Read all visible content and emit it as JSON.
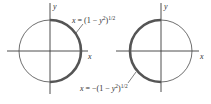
{
  "figure": {
    "panels": [
      {
        "id": "right-half",
        "axis_labels": {
          "x": "x",
          "y": "y"
        },
        "highlighted_arc": "right",
        "equation": {
          "lhs": "x",
          "rhs_prefix": "(1 − ",
          "var": "y",
          "exp_sq": "2",
          "close": ")",
          "exp_half": "1/2",
          "eq": " = "
        }
      },
      {
        "id": "left-half",
        "axis_labels": {
          "x": "x",
          "y": "y"
        },
        "highlighted_arc": "left",
        "equation": {
          "lhs": "x",
          "rhs_prefix": "−(1 − ",
          "var": "y",
          "exp_sq": "2",
          "close": ")",
          "exp_half": "1/2",
          "eq": " = "
        }
      }
    ],
    "colors": {
      "axis": "#3a3a3a",
      "circle": "#4a4a4a",
      "highlight": "#555555"
    }
  }
}
